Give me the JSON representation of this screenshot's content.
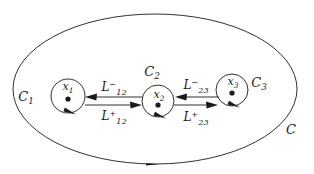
{
  "figure": {
    "type": "contour-diagram",
    "title": "",
    "background_color": "#ffffff",
    "stroke_color": "#1a1a1a",
    "outer_contour": {
      "name": "C",
      "label": "C",
      "shape": "ellipse",
      "cx": 155,
      "cy": 89,
      "rx": 142,
      "ry": 75,
      "label_x": 291,
      "label_y": 134,
      "direction": "counterclockwise",
      "arrow_position": "bottom-center"
    },
    "inner_contours": [
      {
        "name": "C1",
        "label": "C",
        "sub": "1",
        "cx": 68,
        "cy": 96,
        "r": 17,
        "label_x": 26,
        "label_y": 101,
        "point": {
          "label": "x",
          "sub": "1",
          "x": 68,
          "y": 99,
          "label_x": 68,
          "label_y": 88
        },
        "arrow_position": "bottom-right"
      },
      {
        "name": "C2",
        "label": "C",
        "sub": "2",
        "cx": 158,
        "cy": 101,
        "r": 16,
        "label_x": 152,
        "label_y": 76,
        "point": {
          "label": "x",
          "sub": "2",
          "x": 158,
          "y": 105,
          "label_x": 160,
          "label_y": 96
        },
        "arrow_position": "bottom-right"
      },
      {
        "name": "C3",
        "label": "C",
        "sub": "3",
        "cx": 232,
        "cy": 90,
        "r": 16,
        "label_x": 259,
        "label_y": 87,
        "point": {
          "label": "x",
          "sub": "3",
          "x": 232,
          "y": 93,
          "label_x": 233,
          "label_y": 84
        },
        "arrow_position": "bottom-right"
      }
    ],
    "connectors": [
      {
        "name": "L12-minus",
        "label": "L",
        "sub": "12",
        "sup": "−",
        "label_x": 114,
        "label_y": 90,
        "x1": 142,
        "y1": 97,
        "x2": 86,
        "y2": 97,
        "direction": "left"
      },
      {
        "name": "L12-plus",
        "label": "L",
        "sub": "12",
        "sup": "+",
        "label_x": 114,
        "label_y": 121,
        "x1": 86,
        "y1": 105,
        "x2": 142,
        "y2": 105,
        "direction": "right"
      },
      {
        "name": "L23-minus",
        "label": "L",
        "sub": "23",
        "sup": "−",
        "label_x": 196,
        "label_y": 88,
        "x1": 219,
        "y1": 97,
        "x2": 175,
        "y2": 97,
        "direction": "left"
      },
      {
        "name": "L23-plus",
        "label": "L",
        "sub": "23",
        "sup": "+",
        "label_x": 196,
        "label_y": 122,
        "x1": 174,
        "y1": 105,
        "x2": 218,
        "y2": 105,
        "direction": "right"
      }
    ]
  }
}
